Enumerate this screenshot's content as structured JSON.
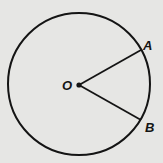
{
  "figure": {
    "background": "#e6e6e4",
    "stroke_color": "#141414",
    "circle": {
      "cx": 79,
      "cy": 84,
      "r": 71,
      "stroke_width": 2
    },
    "center": {
      "label": "O",
      "x": 79,
      "y": 85,
      "label_x": 62,
      "label_y": 90
    },
    "points": [
      {
        "label": "A",
        "x": 141,
        "y": 50,
        "label_x": 143,
        "label_y": 50
      },
      {
        "label": "B",
        "x": 141,
        "y": 120,
        "label_x": 145,
        "label_y": 132
      }
    ],
    "segments": [
      {
        "name": "radius-OA",
        "from": "O",
        "to": "A"
      },
      {
        "name": "radius-OB",
        "from": "O",
        "to": "B"
      }
    ]
  }
}
